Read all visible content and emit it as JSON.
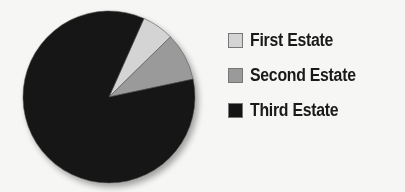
{
  "chart_data": {
    "type": "pie",
    "title": "",
    "categories": [
      "First Estate",
      "Second Estate",
      "Third Estate"
    ],
    "values": [
      6,
      9,
      85
    ],
    "colors": [
      "#d4d4d4",
      "#9a9a9a",
      "#141414"
    ],
    "start_angle_deg": 24,
    "legend_position": "right"
  },
  "legend": {
    "items": [
      {
        "label": "First Estate",
        "color": "#d4d4d4"
      },
      {
        "label": "Second Estate",
        "color": "#9a9a9a"
      },
      {
        "label": "Third Estate",
        "color": "#141414"
      }
    ]
  }
}
